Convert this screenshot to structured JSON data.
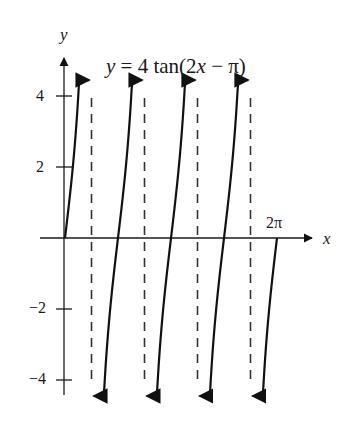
{
  "chart_data": {
    "type": "line",
    "title": "y = 4 tan(2x − π)",
    "function": "y = 4*tan(2*x - pi)",
    "xlabel": "x",
    "ylabel": "y",
    "xlim": [
      0,
      6.2832
    ],
    "ylim": [
      -4.4,
      4.4
    ],
    "x_tick_labels": [
      {
        "value": 6.2832,
        "label": "2π"
      }
    ],
    "y_ticks": [
      4,
      2,
      -2,
      -4
    ],
    "y_tick_labels": [
      "4",
      "2",
      "−2",
      "−4"
    ],
    "asymptotes_x": [
      0.7854,
      2.3562,
      3.927,
      5.4978
    ],
    "asymptote_labels": [
      "π/4",
      "3π/4",
      "5π/4",
      "7π/4"
    ],
    "zeros_x": [
      0,
      1.5708,
      3.1416,
      4.7124,
      6.2832
    ],
    "series": [
      {
        "name": "branch-1",
        "x_range": [
          0,
          0.72
        ],
        "note": "from origin up to y=4 (arrow)"
      },
      {
        "name": "branch-2",
        "x_range": [
          0.85,
          2.29
        ],
        "note": "full branch, arrows at both ends"
      },
      {
        "name": "branch-3",
        "x_range": [
          2.42,
          3.86
        ],
        "note": "full branch, arrows at both ends"
      },
      {
        "name": "branch-4",
        "x_range": [
          3.99,
          5.43
        ],
        "note": "full branch, arrows at both ends"
      },
      {
        "name": "branch-5",
        "x_range": [
          5.56,
          6.2832
        ],
        "note": "from y=-4 (arrow) up to x-axis at 2π"
      }
    ],
    "grid": false,
    "legend": "none"
  },
  "labels": {
    "equation_lhs": "y",
    "equation_rest": " = 4 tan(2",
    "equation_x": "x",
    "equation_tail": " − π)",
    "y_axis": "y",
    "x_axis": "x",
    "two_pi": "2π",
    "y4": "4",
    "y2": "2",
    "ym2": "−2",
    "ym4": "−4"
  }
}
